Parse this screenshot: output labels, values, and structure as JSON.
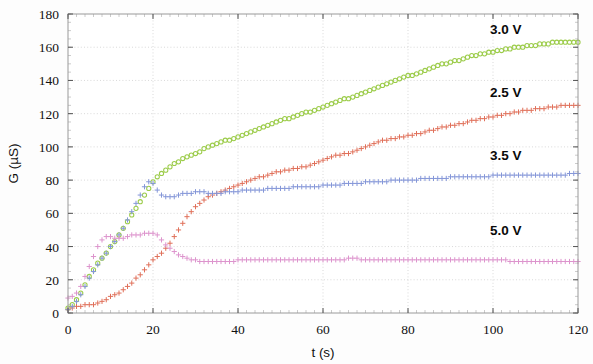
{
  "chart_data": {
    "type": "scatter",
    "title": "",
    "subtitle": "",
    "xlabel": "t (s)",
    "ylabel": "G (µS)",
    "xlim": [
      0,
      120
    ],
    "ylim": [
      0,
      180
    ],
    "xticks": [
      0,
      20,
      40,
      60,
      80,
      100,
      120
    ],
    "yticks": [
      0,
      20,
      40,
      60,
      80,
      100,
      120,
      140,
      160,
      180
    ],
    "xtick_labels": [
      "0",
      "20",
      "40",
      "60",
      "80",
      "100",
      "120"
    ],
    "ytick_labels": [
      "0",
      "20",
      "40",
      "60",
      "80",
      "100",
      "120",
      "140",
      "160",
      "180"
    ],
    "grid": true,
    "grid_style": "dotted",
    "legend_position": "inline-right-annotations",
    "annotations": [
      {
        "text": "3.0 V",
        "x": 103,
        "y": 168,
        "color": "#8cc63f"
      },
      {
        "text": "2.5 V",
        "x": 103,
        "y": 130,
        "color": "#e06a4e"
      },
      {
        "text": "3.5 V",
        "x": 103,
        "y": 92,
        "color": "#7a8fd0"
      },
      {
        "text": "5.0 V",
        "x": 103,
        "y": 47,
        "color": "#d98cc8"
      }
    ],
    "series": [
      {
        "name": "3.0 V",
        "color": "#9ccc4a",
        "marker": "circle",
        "x": [
          0,
          1,
          2,
          3,
          4,
          5,
          6,
          7,
          8,
          9,
          10,
          11,
          12,
          13,
          14,
          15,
          16,
          17,
          18,
          19,
          20,
          21,
          22,
          23,
          24,
          25,
          26,
          27,
          28,
          29,
          30,
          31,
          32,
          33,
          34,
          35,
          36,
          37,
          38,
          39,
          40,
          41,
          42,
          43,
          44,
          45,
          46,
          47,
          48,
          49,
          50,
          51,
          52,
          53,
          54,
          55,
          56,
          57,
          58,
          59,
          60,
          61,
          62,
          63,
          64,
          65,
          66,
          67,
          68,
          69,
          70,
          71,
          72,
          73,
          74,
          75,
          76,
          77,
          78,
          79,
          80,
          81,
          82,
          83,
          84,
          85,
          86,
          87,
          88,
          89,
          90,
          91,
          92,
          93,
          94,
          95,
          96,
          97,
          98,
          99,
          100,
          101,
          102,
          103,
          104,
          105,
          106,
          107,
          108,
          109,
          110,
          111,
          112,
          113,
          114,
          115,
          116,
          117,
          118,
          119,
          120
        ],
        "y": [
          3,
          5,
          8,
          12,
          17,
          22,
          26,
          30,
          33,
          36,
          40,
          43,
          47,
          51,
          55,
          59,
          63,
          67,
          71,
          75,
          79,
          82,
          84,
          86,
          88,
          90,
          91,
          93,
          94,
          95,
          96,
          97,
          99,
          100,
          101,
          102,
          103,
          104,
          104,
          105,
          106,
          107,
          108,
          109,
          110,
          111,
          112,
          113,
          114,
          115,
          116,
          117,
          117,
          118,
          119,
          120,
          121,
          121,
          122,
          123,
          124,
          125,
          126,
          127,
          128,
          129,
          129,
          130,
          131,
          132,
          133,
          134,
          135,
          136,
          137,
          138,
          139,
          140,
          141,
          142,
          143,
          143,
          144,
          145,
          146,
          147,
          148,
          149,
          150,
          150,
          151,
          152,
          152,
          153,
          154,
          155,
          155,
          156,
          156,
          157,
          157,
          158,
          158,
          159,
          159,
          160,
          160,
          160,
          161,
          161,
          161,
          162,
          162,
          162,
          163,
          163,
          163,
          163,
          163,
          163,
          163
        ]
      },
      {
        "name": "2.5 V",
        "color": "#e0705a",
        "marker": "plus",
        "x": [
          0,
          1,
          2,
          3,
          4,
          5,
          6,
          7,
          8,
          9,
          10,
          11,
          12,
          13,
          14,
          15,
          16,
          17,
          18,
          19,
          20,
          21,
          22,
          23,
          24,
          25,
          26,
          27,
          28,
          29,
          30,
          31,
          32,
          33,
          34,
          35,
          36,
          37,
          38,
          39,
          40,
          41,
          42,
          43,
          44,
          45,
          46,
          47,
          48,
          49,
          50,
          51,
          52,
          53,
          54,
          55,
          56,
          57,
          58,
          59,
          60,
          61,
          62,
          63,
          64,
          65,
          66,
          67,
          68,
          69,
          70,
          71,
          72,
          73,
          74,
          75,
          76,
          77,
          78,
          79,
          80,
          81,
          82,
          83,
          84,
          85,
          86,
          87,
          88,
          89,
          90,
          91,
          92,
          93,
          94,
          95,
          96,
          97,
          98,
          99,
          100,
          101,
          102,
          103,
          104,
          105,
          106,
          107,
          108,
          109,
          110,
          111,
          112,
          113,
          114,
          115,
          116,
          117,
          118,
          119,
          120
        ],
        "y": [
          2,
          3,
          4,
          4,
          5,
          5,
          5,
          6,
          7,
          8,
          10,
          11,
          12,
          14,
          16,
          18,
          21,
          23,
          26,
          29,
          32,
          34,
          36,
          39,
          42,
          46,
          50,
          54,
          58,
          61,
          64,
          66,
          68,
          70,
          71,
          72,
          73,
          74,
          75,
          76,
          77,
          78,
          79,
          80,
          81,
          82,
          82,
          83,
          84,
          85,
          85,
          86,
          86,
          87,
          87,
          88,
          88,
          89,
          90,
          91,
          92,
          93,
          94,
          95,
          95,
          96,
          96,
          97,
          98,
          99,
          100,
          101,
          102,
          103,
          104,
          104,
          105,
          105,
          106,
          106,
          107,
          107,
          108,
          108,
          109,
          110,
          110,
          111,
          112,
          112,
          113,
          113,
          114,
          114,
          115,
          116,
          116,
          117,
          117,
          118,
          118,
          119,
          119,
          120,
          120,
          121,
          121,
          122,
          122,
          122,
          123,
          123,
          123,
          124,
          124,
          124,
          125,
          125,
          125,
          125,
          125
        ]
      },
      {
        "name": "3.5 V",
        "color": "#8496d8",
        "marker": "plus",
        "x": [
          0,
          1,
          2,
          3,
          4,
          5,
          6,
          7,
          8,
          9,
          10,
          11,
          12,
          13,
          14,
          15,
          16,
          17,
          18,
          19,
          20,
          21,
          22,
          23,
          24,
          25,
          26,
          27,
          28,
          29,
          30,
          31,
          32,
          33,
          34,
          35,
          36,
          37,
          38,
          39,
          40,
          41,
          42,
          43,
          44,
          45,
          46,
          47,
          48,
          49,
          50,
          51,
          52,
          53,
          54,
          55,
          56,
          57,
          58,
          59,
          60,
          61,
          62,
          63,
          64,
          65,
          66,
          67,
          68,
          69,
          70,
          71,
          72,
          73,
          74,
          75,
          76,
          77,
          78,
          79,
          80,
          81,
          82,
          83,
          84,
          85,
          86,
          87,
          88,
          89,
          90,
          91,
          92,
          93,
          94,
          95,
          96,
          97,
          98,
          99,
          100,
          101,
          102,
          103,
          104,
          105,
          106,
          107,
          108,
          109,
          110,
          111,
          112,
          113,
          114,
          115,
          116,
          117,
          118,
          119,
          120
        ],
        "y": [
          2,
          4,
          7,
          11,
          16,
          21,
          25,
          29,
          33,
          36,
          40,
          43,
          47,
          51,
          56,
          61,
          66,
          71,
          76,
          79,
          78,
          74,
          71,
          70,
          70,
          70,
          71,
          72,
          72,
          72,
          73,
          73,
          73,
          72,
          72,
          72,
          72,
          73,
          73,
          73,
          73,
          74,
          74,
          74,
          74,
          74,
          74,
          75,
          75,
          75,
          75,
          75,
          75,
          76,
          76,
          76,
          76,
          76,
          76,
          76,
          77,
          77,
          77,
          77,
          77,
          78,
          78,
          78,
          78,
          78,
          79,
          79,
          79,
          79,
          79,
          79,
          80,
          80,
          80,
          80,
          80,
          80,
          80,
          81,
          81,
          81,
          81,
          81,
          81,
          81,
          82,
          82,
          82,
          82,
          82,
          82,
          82,
          82,
          82,
          82,
          83,
          83,
          83,
          83,
          83,
          83,
          83,
          83,
          83,
          83,
          83,
          83,
          83,
          83,
          83,
          83,
          83,
          83,
          84,
          84,
          84
        ]
      },
      {
        "name": "5.0 V",
        "color": "#dd94cd",
        "marker": "plus",
        "x": [
          0,
          1,
          2,
          3,
          4,
          5,
          6,
          7,
          8,
          9,
          10,
          11,
          12,
          13,
          14,
          15,
          16,
          17,
          18,
          19,
          20,
          21,
          22,
          23,
          24,
          25,
          26,
          27,
          28,
          29,
          30,
          31,
          32,
          33,
          34,
          35,
          36,
          37,
          38,
          39,
          40,
          41,
          42,
          43,
          44,
          45,
          46,
          47,
          48,
          49,
          50,
          51,
          52,
          53,
          54,
          55,
          56,
          57,
          58,
          59,
          60,
          61,
          62,
          63,
          64,
          65,
          66,
          67,
          68,
          69,
          70,
          71,
          72,
          73,
          74,
          75,
          76,
          77,
          78,
          79,
          80,
          81,
          82,
          83,
          84,
          85,
          86,
          87,
          88,
          89,
          90,
          91,
          92,
          93,
          94,
          95,
          96,
          97,
          98,
          99,
          100,
          101,
          102,
          103,
          104,
          105,
          106,
          107,
          108,
          109,
          110,
          111,
          112,
          113,
          114,
          115,
          116,
          117,
          118,
          119,
          120
        ],
        "y": [
          9,
          10,
          12,
          16,
          22,
          28,
          34,
          40,
          44,
          46,
          46,
          45,
          45,
          45,
          46,
          47,
          47,
          47,
          48,
          48,
          48,
          47,
          44,
          41,
          39,
          37,
          35,
          34,
          33,
          32,
          32,
          31,
          31,
          31,
          31,
          31,
          31,
          31,
          31,
          31,
          32,
          32,
          32,
          32,
          32,
          32,
          32,
          32,
          32,
          32,
          32,
          32,
          32,
          32,
          32,
          32,
          32,
          32,
          32,
          32,
          32,
          32,
          32,
          32,
          32,
          32,
          33,
          33,
          33,
          32,
          32,
          32,
          32,
          32,
          32,
          32,
          32,
          32,
          32,
          32,
          32,
          32,
          32,
          32,
          32,
          32,
          32,
          32,
          32,
          32,
          32,
          32,
          32,
          32,
          32,
          32,
          32,
          32,
          32,
          32,
          32,
          32,
          32,
          32,
          31,
          31,
          31,
          31,
          31,
          31,
          31,
          31,
          31,
          31,
          31,
          31,
          31,
          31,
          31,
          31,
          31
        ]
      }
    ]
  },
  "plot_geometry": {
    "left": 68,
    "right": 578,
    "top": 14,
    "bottom": 313
  }
}
